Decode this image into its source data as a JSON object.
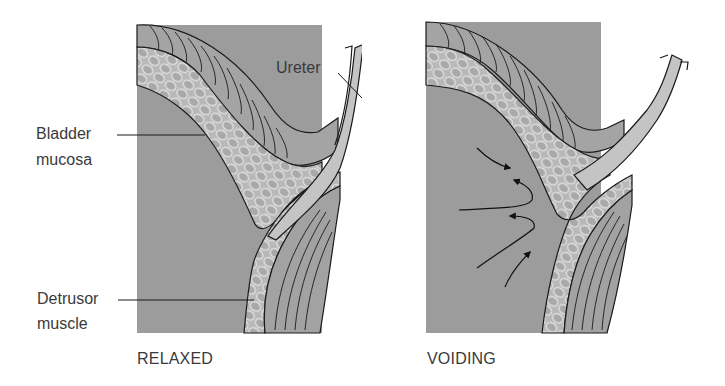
{
  "figure": {
    "panels": [
      {
        "id": "relaxed",
        "caption": "RELAXED",
        "labels": {
          "ureter": "Ureter",
          "bladder_mucosa_line1": "Bladder",
          "bladder_mucosa_line2": "mucosa",
          "detrusor_line1": "Detrusor",
          "detrusor_line2": "muscle"
        }
      },
      {
        "id": "voiding",
        "caption": "VOIDING"
      }
    ],
    "colors": {
      "lumen": "#9a9a9a",
      "mucosa": "#bdbdbd",
      "mucosa_cells": "#e3e3e3",
      "muscle": "#a8a8a8",
      "ureter": "#c2c2c2",
      "outline": "#1a1a1a"
    }
  }
}
